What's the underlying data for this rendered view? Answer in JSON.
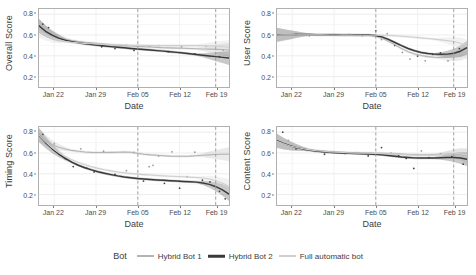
{
  "chart_data": {
    "type": "line",
    "title": "",
    "layout": "2x2 facet grid of scatter points with LOESS smooth lines and confidence bands",
    "xlabel": "Date",
    "x_tick_labels": [
      "Jan 22",
      "Jan 29",
      "Feb 05",
      "Feb 12",
      "Feb 19"
    ],
    "x_tick_positions": [
      0.08,
      0.3,
      0.52,
      0.74,
      0.93
    ],
    "ylim": [
      0.1,
      0.85
    ],
    "y_tick_labels": [
      "0.2",
      "0.4",
      "0.6",
      "0.8"
    ],
    "y_tick_values": [
      0.2,
      0.4,
      0.6,
      0.8
    ],
    "grid": true,
    "legend_position": "bottom",
    "legend_title": "Bot",
    "reference_lines": [
      {
        "label": "Feb 05",
        "x": 0.52,
        "style": "dashed",
        "color": "#9a9a9a"
      },
      {
        "label": "Feb 19",
        "x": 0.93,
        "style": "dashed",
        "color": "#9a9a9a"
      }
    ],
    "series_names": [
      "Hybrid Bot 1",
      "Hybrid Bot 2",
      "Full automatic bot"
    ],
    "series_colors": [
      "#b4b4b4",
      "#3a3a3a",
      "#cfcfcf"
    ],
    "panels": [
      {
        "ylabel": "Overall Score",
        "series": [
          {
            "name": "Hybrid Bot 1",
            "values": [
              0.69,
              0.64,
              0.605,
              0.578,
              0.56,
              0.548,
              0.538,
              0.53,
              0.524,
              0.518,
              0.512,
              0.507,
              0.502,
              0.498,
              0.494,
              0.49,
              0.487,
              0.484,
              0.481,
              0.478,
              0.476,
              0.474,
              0.472,
              0.47,
              0.468,
              0.466,
              0.464,
              0.462,
              0.46,
              0.455
            ]
          },
          {
            "name": "Hybrid Bot 2",
            "values": [
              0.688,
              0.636,
              0.598,
              0.57,
              0.55,
              0.536,
              0.525,
              0.516,
              0.508,
              0.501,
              0.494,
              0.488,
              0.482,
              0.477,
              0.471,
              0.466,
              0.461,
              0.456,
              0.45,
              0.445,
              0.439,
              0.433,
              0.427,
              0.42,
              0.413,
              0.406,
              0.399,
              0.392,
              0.385,
              0.378
            ]
          },
          {
            "name": "Full automatic bot",
            "values": [
              0.64,
              0.6,
              0.572,
              0.553,
              0.54,
              0.531,
              0.524,
              0.519,
              0.515,
              0.512,
              0.509,
              0.507,
              0.505,
              0.503,
              0.502,
              0.501,
              0.5,
              0.499,
              0.499,
              0.498,
              0.498,
              0.498,
              0.498,
              0.498,
              0.498,
              0.498,
              0.497,
              0.495,
              0.49,
              0.482
            ]
          }
        ],
        "points": [
          {
            "series": "Hybrid Bot 2",
            "x": 0.02,
            "y": 0.705
          },
          {
            "series": "Hybrid Bot 2",
            "x": 0.05,
            "y": 0.672
          },
          {
            "series": "Hybrid Bot 1",
            "x": 0.12,
            "y": 0.56
          },
          {
            "series": "Full automatic bot",
            "x": 0.18,
            "y": 0.53
          },
          {
            "series": "Full automatic bot",
            "x": 0.22,
            "y": 0.522
          },
          {
            "series": "Hybrid Bot 1",
            "x": 0.27,
            "y": 0.512
          },
          {
            "series": "Hybrid Bot 2",
            "x": 0.33,
            "y": 0.487
          },
          {
            "series": "Hybrid Bot 2",
            "x": 0.4,
            "y": 0.47
          },
          {
            "series": "Hybrid Bot 1",
            "x": 0.46,
            "y": 0.5
          },
          {
            "series": "Hybrid Bot 2",
            "x": 0.5,
            "y": 0.452
          },
          {
            "series": "Hybrid Bot 1",
            "x": 0.58,
            "y": 0.492
          },
          {
            "series": "Full automatic bot",
            "x": 0.63,
            "y": 0.499
          },
          {
            "series": "Hybrid Bot 2",
            "x": 0.68,
            "y": 0.44
          },
          {
            "series": "Hybrid Bot 1",
            "x": 0.75,
            "y": 0.487
          },
          {
            "series": "Hybrid Bot 2",
            "x": 0.82,
            "y": 0.418
          },
          {
            "series": "Full automatic bot",
            "x": 0.88,
            "y": 0.496
          },
          {
            "series": "Hybrid Bot 2",
            "x": 0.95,
            "y": 0.392
          },
          {
            "series": "Hybrid Bot 1",
            "x": 0.97,
            "y": 0.455
          }
        ]
      },
      {
        "ylabel": "User Score",
        "series": [
          {
            "name": "Hybrid Bot 1",
            "values": [
              0.6,
              0.601,
              0.601,
              0.602,
              0.602,
              0.602,
              0.601,
              0.601,
              0.6,
              0.6,
              0.599,
              0.599,
              0.598,
              0.598,
              0.597,
              0.59,
              0.57,
              0.54,
              0.505,
              0.47,
              0.44,
              0.418,
              0.402,
              0.392,
              0.386,
              0.384,
              0.385,
              0.392,
              0.41,
              0.44
            ]
          },
          {
            "name": "Hybrid Bot 2",
            "values": [
              0.602,
              0.603,
              0.603,
              0.604,
              0.604,
              0.604,
              0.603,
              0.603,
              0.602,
              0.602,
              0.601,
              0.601,
              0.6,
              0.6,
              0.6,
              0.596,
              0.582,
              0.558,
              0.528,
              0.498,
              0.47,
              0.448,
              0.432,
              0.422,
              0.416,
              0.414,
              0.416,
              0.424,
              0.444,
              0.478
            ]
          },
          {
            "name": "Full automatic bot",
            "values": [
              0.6,
              0.601,
              0.601,
              0.602,
              0.602,
              0.602,
              0.601,
              0.601,
              0.6,
              0.6,
              0.599,
              0.599,
              0.598,
              0.598,
              0.598,
              0.598,
              0.597,
              0.595,
              0.592,
              0.588,
              0.583,
              0.578,
              0.572,
              0.566,
              0.56,
              0.553,
              0.546,
              0.538,
              0.52,
              0.488
            ]
          }
        ],
        "points": [
          {
            "series": "Hybrid Bot 1",
            "x": 0.04,
            "y": 0.598
          },
          {
            "series": "Hybrid Bot 2",
            "x": 0.1,
            "y": 0.605
          },
          {
            "series": "Hybrid Bot 1",
            "x": 0.17,
            "y": 0.592
          },
          {
            "series": "Full automatic bot",
            "x": 0.24,
            "y": 0.604
          },
          {
            "series": "Hybrid Bot 2",
            "x": 0.31,
            "y": 0.598
          },
          {
            "series": "Hybrid Bot 1",
            "x": 0.38,
            "y": 0.606
          },
          {
            "series": "Hybrid Bot 2",
            "x": 0.45,
            "y": 0.596
          },
          {
            "series": "Hybrid Bot 2",
            "x": 0.52,
            "y": 0.64
          },
          {
            "series": "Hybrid Bot 1",
            "x": 0.55,
            "y": 0.556
          },
          {
            "series": "Full automatic bot",
            "x": 0.58,
            "y": 0.614
          },
          {
            "series": "Hybrid Bot 2",
            "x": 0.62,
            "y": 0.5
          },
          {
            "series": "Hybrid Bot 1",
            "x": 0.66,
            "y": 0.432
          },
          {
            "series": "Hybrid Bot 1",
            "x": 0.7,
            "y": 0.368
          },
          {
            "series": "Hybrid Bot 2",
            "x": 0.74,
            "y": 0.398
          },
          {
            "series": "Hybrid Bot 1",
            "x": 0.78,
            "y": 0.352
          },
          {
            "series": "Hybrid Bot 2",
            "x": 0.82,
            "y": 0.414
          },
          {
            "series": "Hybrid Bot 2",
            "x": 0.86,
            "y": 0.428
          },
          {
            "series": "Hybrid Bot 1",
            "x": 0.9,
            "y": 0.35
          },
          {
            "series": "Hybrid Bot 2",
            "x": 0.96,
            "y": 0.47
          }
        ]
      },
      {
        "ylabel": "Timing Score",
        "series": [
          {
            "name": "Hybrid Bot 1",
            "values": [
              0.775,
              0.72,
              0.68,
              0.655,
              0.638,
              0.625,
              0.616,
              0.61,
              0.606,
              0.604,
              0.604,
              0.606,
              0.608,
              0.61,
              0.608,
              0.598,
              0.588,
              0.582,
              0.578,
              0.574,
              0.57,
              0.568,
              0.568,
              0.57,
              0.574,
              0.578,
              0.582,
              0.586,
              0.588,
              0.588
            ]
          },
          {
            "name": "Hybrid Bot 2",
            "values": [
              0.77,
              0.7,
              0.64,
              0.59,
              0.548,
              0.512,
              0.482,
              0.458,
              0.438,
              0.42,
              0.405,
              0.392,
              0.38,
              0.37,
              0.362,
              0.355,
              0.35,
              0.345,
              0.341,
              0.337,
              0.334,
              0.33,
              0.327,
              0.324,
              0.32,
              0.312,
              0.298,
              0.276,
              0.245,
              0.205
            ]
          },
          {
            "name": "Full automatic bot",
            "values": [
              0.772,
              0.706,
              0.65,
              0.604,
              0.566,
              0.534,
              0.508,
              0.486,
              0.468,
              0.452,
              0.439,
              0.428,
              0.418,
              0.41,
              0.403,
              0.397,
              0.392,
              0.388,
              0.384,
              0.38,
              0.377,
              0.374,
              0.371,
              0.368,
              0.365,
              0.36,
              0.35,
              0.334,
              0.31,
              0.28
            ]
          }
        ],
        "points": [
          {
            "series": "Hybrid Bot 2",
            "x": 0.02,
            "y": 0.78
          },
          {
            "series": "Hybrid Bot 1",
            "x": 0.08,
            "y": 0.688
          },
          {
            "series": "Hybrid Bot 2",
            "x": 0.14,
            "y": 0.545
          },
          {
            "series": "Hybrid Bot 2",
            "x": 0.18,
            "y": 0.47
          },
          {
            "series": "Hybrid Bot 1",
            "x": 0.22,
            "y": 0.64
          },
          {
            "series": "Hybrid Bot 2",
            "x": 0.25,
            "y": 0.455
          },
          {
            "series": "Hybrid Bot 2",
            "x": 0.29,
            "y": 0.418
          },
          {
            "series": "Hybrid Bot 1",
            "x": 0.34,
            "y": 0.618
          },
          {
            "series": "Hybrid Bot 2",
            "x": 0.4,
            "y": 0.395
          },
          {
            "series": "Full automatic bot",
            "x": 0.46,
            "y": 0.43
          },
          {
            "series": "Hybrid Bot 1",
            "x": 0.5,
            "y": 0.605
          },
          {
            "series": "Hybrid Bot 2",
            "x": 0.55,
            "y": 0.33
          },
          {
            "series": "Full automatic bot",
            "x": 0.58,
            "y": 0.468
          },
          {
            "series": "Full automatic bot",
            "x": 0.6,
            "y": 0.482
          },
          {
            "series": "Hybrid Bot 1",
            "x": 0.63,
            "y": 0.572
          },
          {
            "series": "Hybrid Bot 2",
            "x": 0.66,
            "y": 0.308
          },
          {
            "series": "Hybrid Bot 1",
            "x": 0.7,
            "y": 0.612
          },
          {
            "series": "Hybrid Bot 2",
            "x": 0.74,
            "y": 0.262
          },
          {
            "series": "Full automatic bot",
            "x": 0.78,
            "y": 0.372
          },
          {
            "series": "Hybrid Bot 1",
            "x": 0.82,
            "y": 0.608
          },
          {
            "series": "Hybrid Bot 2",
            "x": 0.86,
            "y": 0.338
          },
          {
            "series": "Hybrid Bot 2",
            "x": 0.9,
            "y": 0.322
          },
          {
            "series": "Hybrid Bot 2",
            "x": 0.95,
            "y": 0.232
          },
          {
            "series": "Hybrid Bot 2",
            "x": 0.98,
            "y": 0.16
          }
        ]
      },
      {
        "ylabel": "Content Score",
        "series": [
          {
            "name": "Hybrid Bot 1",
            "values": [
              0.715,
              0.69,
              0.67,
              0.654,
              0.642,
              0.632,
              0.624,
              0.618,
              0.613,
              0.609,
              0.606,
              0.603,
              0.601,
              0.6,
              0.599,
              0.598,
              0.597,
              0.595,
              0.592,
              0.589,
              0.586,
              0.584,
              0.583,
              0.583,
              0.584,
              0.586,
              0.589,
              0.591,
              0.588,
              0.572
            ]
          },
          {
            "name": "Hybrid Bot 2",
            "values": [
              0.718,
              0.692,
              0.67,
              0.652,
              0.638,
              0.627,
              0.618,
              0.611,
              0.606,
              0.602,
              0.599,
              0.597,
              0.595,
              0.593,
              0.591,
              0.588,
              0.583,
              0.576,
              0.569,
              0.562,
              0.557,
              0.553,
              0.551,
              0.551,
              0.552,
              0.554,
              0.556,
              0.556,
              0.552,
              0.54
            ]
          },
          {
            "name": "Full automatic bot",
            "values": [
              0.712,
              0.688,
              0.668,
              0.652,
              0.64,
              0.63,
              0.622,
              0.616,
              0.611,
              0.607,
              0.604,
              0.601,
              0.599,
              0.598,
              0.597,
              0.596,
              0.594,
              0.591,
              0.588,
              0.585,
              0.582,
              0.58,
              0.579,
              0.579,
              0.581,
              0.584,
              0.588,
              0.592,
              0.592,
              0.582
            ]
          }
        ],
        "points": [
          {
            "series": "Hybrid Bot 2",
            "x": 0.03,
            "y": 0.8
          },
          {
            "series": "Hybrid Bot 1",
            "x": 0.06,
            "y": 0.722
          },
          {
            "series": "Hybrid Bot 2",
            "x": 0.1,
            "y": 0.64
          },
          {
            "series": "Full automatic bot",
            "x": 0.15,
            "y": 0.628
          },
          {
            "series": "Hybrid Bot 1",
            "x": 0.2,
            "y": 0.618
          },
          {
            "series": "Hybrid Bot 2",
            "x": 0.25,
            "y": 0.588
          },
          {
            "series": "Hybrid Bot 1",
            "x": 0.3,
            "y": 0.612
          },
          {
            "series": "Hybrid Bot 2",
            "x": 0.36,
            "y": 0.596
          },
          {
            "series": "Hybrid Bot 1",
            "x": 0.42,
            "y": 0.604
          },
          {
            "series": "Hybrid Bot 2",
            "x": 0.48,
            "y": 0.572
          },
          {
            "series": "Hybrid Bot 2",
            "x": 0.55,
            "y": 0.652
          },
          {
            "series": "Hybrid Bot 1",
            "x": 0.6,
            "y": 0.6
          },
          {
            "series": "Hybrid Bot 2",
            "x": 0.64,
            "y": 0.578
          },
          {
            "series": "Hybrid Bot 2",
            "x": 0.68,
            "y": 0.548
          },
          {
            "series": "Hybrid Bot 2",
            "x": 0.72,
            "y": 0.452
          },
          {
            "series": "Hybrid Bot 1",
            "x": 0.76,
            "y": 0.62
          },
          {
            "series": "Hybrid Bot 2",
            "x": 0.8,
            "y": 0.556
          },
          {
            "series": "Full automatic bot",
            "x": 0.86,
            "y": 0.592
          },
          {
            "series": "Hybrid Bot 2",
            "x": 0.92,
            "y": 0.566
          },
          {
            "series": "Hybrid Bot 2",
            "x": 0.98,
            "y": 0.492
          }
        ]
      }
    ]
  },
  "legend": {
    "title": "Bot",
    "items": [
      {
        "label": "Hybrid Bot 1",
        "color": "#b4b4b4"
      },
      {
        "label": "Hybrid Bot 2",
        "color": "#3a3a3a"
      },
      {
        "label": "Full automatic bot",
        "color": "#cfcfcf"
      }
    ]
  }
}
